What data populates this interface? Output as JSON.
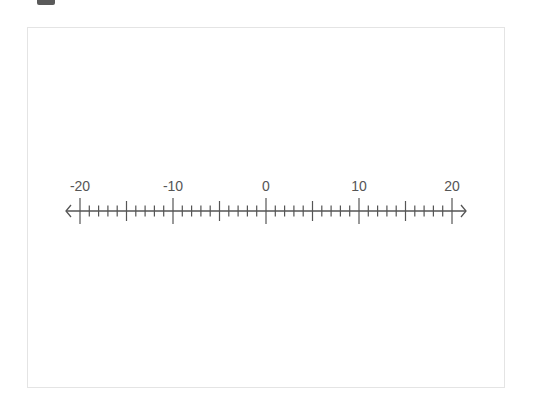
{
  "diagram": {
    "type": "number-line",
    "min": -20,
    "max": 20,
    "minor_step": 1,
    "medium_step": 5,
    "major_step": 10,
    "labels": [
      {
        "value": -20,
        "text": "-20"
      },
      {
        "value": -10,
        "text": "-10"
      },
      {
        "value": 0,
        "text": "0"
      },
      {
        "value": 10,
        "text": "10"
      },
      {
        "value": 20,
        "text": "20"
      }
    ],
    "arrows": [
      "left",
      "right"
    ],
    "colors": {
      "line": "#555555",
      "label": "#555555",
      "frame_border": "#e4e4e4",
      "handle": "#5a5a5a"
    }
  }
}
